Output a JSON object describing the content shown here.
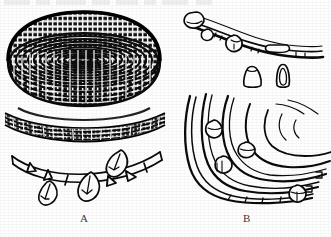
{
  "figure": {
    "domain": "Natural-Image",
    "media": "scanned line-drawing figure plate, black ink on white paper",
    "background_color": "#fefefe",
    "ink_color": "#111111",
    "width": 331,
    "height": 237,
    "top_cropped_text_row": "",
    "panels": [
      {
        "id": "A",
        "label": "A",
        "label_x": 86,
        "label_y": 220,
        "parts": [
          {
            "name": "coiled-basket-perspective-view",
            "description": "shallow coiled basket seen in three-quarter perspective, dense horizontal coil rows with stitch ticks",
            "bbox": [
              8,
              12,
              160,
              106
            ],
            "coil_rows": 17,
            "stitches_per_row": 64
          },
          {
            "name": "weave-detail-band",
            "description": "enlarged crescent detail of the coiled weave texture",
            "bbox": [
              5,
              112,
              165,
              139
            ],
            "coil_rows": 7
          },
          {
            "name": "rim-with-pendants-detail",
            "description": "curved rim band with segment divisions and three leaf-shaped feather or shell pendants hanging below",
            "bbox": [
              10,
              148,
              165,
              202
            ],
            "segment_ticks": 8,
            "pendant_count": 3
          }
        ]
      },
      {
        "id": "B",
        "label": "B",
        "label_x": 247,
        "label_y": 220,
        "parts": [
          {
            "name": "rim-strand-with-beads-detail",
            "description": "curved rim strand sketched in outline with attached beads and lashing",
            "bbox": [
              186,
              12,
              325,
              66
            ],
            "attached_bead_count": 3
          },
          {
            "name": "detached-beads",
            "description": "two isolated bead or pendant outlines drawn below the rim strand",
            "bbox": [
              240,
              62,
              300,
              90
            ],
            "bead_count": 2
          },
          {
            "name": "nested-coil-arcs-fragment",
            "description": "corner of a coiled basket drawn as nested concentric arcs with bead attachments and stepped broken edge",
            "bbox": [
              182,
              92,
              328,
              205
            ],
            "arc_count": 6,
            "bead_count": 4
          }
        ]
      }
    ]
  }
}
